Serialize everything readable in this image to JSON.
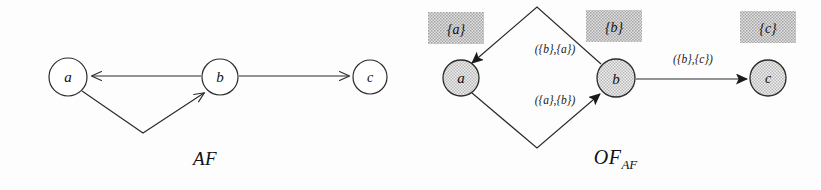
{
  "figure": {
    "background_color": "#fdfdfd",
    "stroke_color": "#2b2b2b",
    "node_fill_left": "#ffffff",
    "node_fill_right": "#d7d7d7",
    "set_box_fill": "#c9c9c9"
  },
  "panels": [
    {
      "id": "af",
      "caption": "AF",
      "nodes": [
        {
          "id": "a",
          "label": "a",
          "cx": 68,
          "cy": 77,
          "r": 19
        },
        {
          "id": "b",
          "label": "b",
          "cx": 220,
          "cy": 77,
          "r": 18
        },
        {
          "id": "c",
          "label": "c",
          "cx": 370,
          "cy": 77,
          "r": 17
        }
      ],
      "edges": [
        {
          "from": "b",
          "to": "a",
          "label": "",
          "style": "straight"
        },
        {
          "from": "b",
          "to": "c",
          "label": "",
          "style": "straight"
        },
        {
          "from": "a",
          "to": "b",
          "label": "",
          "style": "bent-down"
        }
      ]
    },
    {
      "id": "ofaf",
      "caption_main": "OF",
      "caption_sub": "AF",
      "nodes": [
        {
          "id": "a",
          "label": "a",
          "cx": 51,
          "cy": 78,
          "r": 18,
          "set_label": "{a}"
        },
        {
          "id": "b",
          "label": "b",
          "cx": 206,
          "cy": 78,
          "r": 19,
          "set_label": "{b}"
        },
        {
          "id": "c",
          "label": "c",
          "cx": 358,
          "cy": 78,
          "r": 18,
          "set_label": "{c}"
        }
      ],
      "edges": [
        {
          "from": "b",
          "to": "a",
          "label": "({b},{a})",
          "style": "diamond-top"
        },
        {
          "from": "a",
          "to": "b",
          "label": "({a},{b})",
          "style": "diamond-bottom"
        },
        {
          "from": "b",
          "to": "c",
          "label": "({b},{c})",
          "style": "straight"
        }
      ]
    }
  ]
}
